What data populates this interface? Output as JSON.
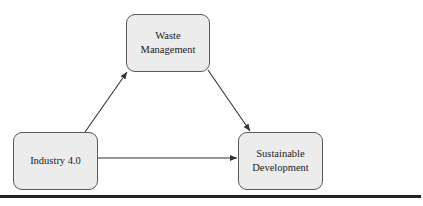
{
  "diagram": {
    "nodes": [
      {
        "id": "waste_management",
        "label": "Waste Management"
      },
      {
        "id": "industry_4_0",
        "label": "Industry 4.0"
      },
      {
        "id": "sustainable_development",
        "label_line1": "Sustainable",
        "label_line2": "Development"
      }
    ],
    "edges": [
      {
        "from": "industry_4_0",
        "to": "waste_management"
      },
      {
        "from": "waste_management",
        "to": "sustainable_development"
      },
      {
        "from": "industry_4_0",
        "to": "sustainable_development"
      }
    ],
    "colors": {
      "node_fill": "#ececec",
      "node_border": "#5a5a5a",
      "edge": "#333333",
      "separator": "#222222"
    }
  }
}
